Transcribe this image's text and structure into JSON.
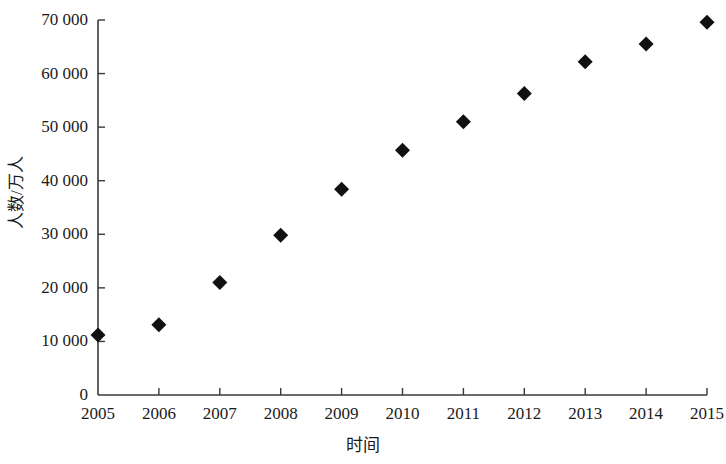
{
  "chart_data": {
    "type": "scatter",
    "title": "",
    "xlabel": "时间",
    "ylabel": "人数/万人",
    "categories": [
      "2005",
      "2006",
      "2007",
      "2008",
      "2009",
      "2010",
      "2011",
      "2012",
      "2013",
      "2014",
      "2015"
    ],
    "x": [
      2005,
      2006,
      2007,
      2008,
      2009,
      2010,
      2011,
      2012,
      2013,
      2014,
      2015
    ],
    "values": [
      11200,
      13100,
      21000,
      29800,
      38400,
      45700,
      51000,
      56300,
      62200,
      65500,
      69600
    ],
    "series": [
      {
        "name": "人数/万人",
        "values": [
          11200,
          13100,
          21000,
          29800,
          38400,
          45700,
          51000,
          56300,
          62200,
          65500,
          69600
        ]
      }
    ],
    "xtick_labels": [
      "2005",
      "2006",
      "2007",
      "2008",
      "2009",
      "2010",
      "2011",
      "2012",
      "2013",
      "2014",
      "2015"
    ],
    "ytick_labels": [
      "0",
      "10 000",
      "20 000",
      "30 000",
      "40 000",
      "50 000",
      "60 000",
      "70 000"
    ],
    "ytick_values": [
      0,
      10000,
      20000,
      30000,
      40000,
      50000,
      60000,
      70000
    ],
    "ylim": [
      0,
      70000
    ],
    "xlim": [
      2005,
      2015
    ],
    "grid": false,
    "legend": false,
    "marker": "diamond",
    "marker_color": "#111111",
    "axis_color": "#3a3a3a"
  }
}
